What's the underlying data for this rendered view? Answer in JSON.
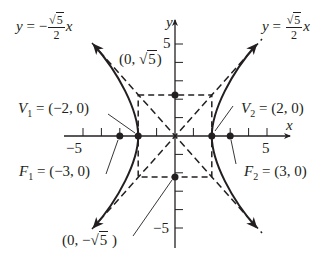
{
  "diagram": {
    "type": "hyperbola",
    "equation": "x^2/4 - y^2/5 = 1",
    "colors": {
      "ink": "#231f20",
      "background": "#ffffff"
    },
    "axes": {
      "x_label": "x",
      "y_label": "y",
      "x_range": [
        -6,
        6
      ],
      "y_range": [
        -6,
        6
      ],
      "tick_labels": {
        "x_neg": "−5",
        "x_pos": "5",
        "y_pos": "5",
        "y_neg": "−5"
      }
    },
    "asymptotes": [
      {
        "name": "negative",
        "text_lhs": "y = −",
        "num": "5",
        "den": "2",
        "var": "x",
        "slope": -1.118
      },
      {
        "name": "positive",
        "text_lhs": "y = ",
        "num": "5",
        "den": "2",
        "var": "x",
        "slope": 1.118
      }
    ],
    "points": {
      "V1": {
        "name": "V",
        "sub": "1",
        "coords": "= (−2, 0)",
        "x": -2,
        "y": 0
      },
      "V2": {
        "name": "V",
        "sub": "2",
        "coords": "= (2, 0)",
        "x": 2,
        "y": 0
      },
      "F1": {
        "name": "F",
        "sub": "1",
        "coords": "= (−3, 0)",
        "x": -3,
        "y": 0
      },
      "F2": {
        "name": "F",
        "sub": "2",
        "coords": "= (3, 0)",
        "x": 3,
        "y": 0
      },
      "B_top": {
        "prefix": "(0, ",
        "rad": "5",
        "suffix": ")",
        "x": 0,
        "y": 2.236
      },
      "B_bottom": {
        "prefix": "(0, −",
        "rad": "5",
        "suffix": " )",
        "x": 0,
        "y": -2.236
      }
    },
    "central_rectangle": {
      "x": [
        -2,
        2
      ],
      "y": [
        -2.236,
        2.236
      ]
    }
  }
}
